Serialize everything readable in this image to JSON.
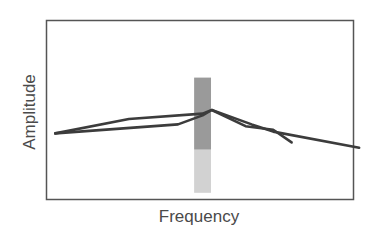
{
  "chart_data": {
    "type": "line",
    "title": "",
    "xlabel": "Frequency",
    "ylabel": "Amplitude",
    "grid": false,
    "legend": null,
    "xlim": [
      0,
      100
    ],
    "ylim": [
      0,
      100
    ],
    "ticks": {
      "x": [],
      "y": []
    },
    "highlight_band": {
      "x_center": 51,
      "width": 5.5,
      "upper_segment": {
        "y_from": 28,
        "y_to": 68,
        "color": "#9a9a9a"
      },
      "lower_segment": {
        "y_from": 4,
        "y_to": 28,
        "color": "#d2d2d2"
      }
    },
    "series": [
      {
        "name": "Curve A",
        "color": "#3c3c3c",
        "points": [
          [
            3,
            37
          ],
          [
            27,
            45
          ],
          [
            51,
            48
          ],
          [
            54,
            50
          ],
          [
            67,
            42
          ],
          [
            74,
            38
          ],
          [
            102,
            29
          ]
        ]
      },
      {
        "name": "Curve B",
        "color": "#3c3c3c",
        "points": [
          [
            3,
            37
          ],
          [
            43,
            42
          ],
          [
            51,
            47
          ],
          [
            54,
            50
          ],
          [
            65,
            41
          ],
          [
            74,
            39
          ],
          [
            80,
            32
          ]
        ]
      }
    ],
    "annotations": []
  }
}
